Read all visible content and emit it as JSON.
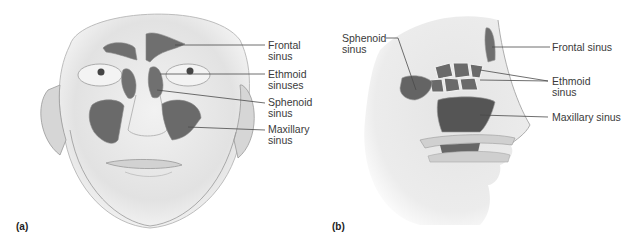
{
  "panels": {
    "a": {
      "letter": "(a)",
      "view": "frontal",
      "labels": {
        "frontal": "Frontal\nsinus",
        "ethmoid": "Ethmoid\nsinuses",
        "sphenoid": "Sphenoid\nsinus",
        "maxillary": "Maxillary\nsinus"
      }
    },
    "b": {
      "letter": "(b)",
      "view": "sagittal",
      "labels": {
        "sphenoid": "Sphenoid\nsinus",
        "frontal": "Frontal sinus",
        "ethmoid": "Ethmoid\nsinus",
        "maxillary": "Maxillary sinus"
      }
    }
  },
  "colors": {
    "sinus_fill": "#6b6b6b",
    "skin": "#e6e6e6",
    "line": "#4a4a4a",
    "text": "#3a3a3a"
  }
}
